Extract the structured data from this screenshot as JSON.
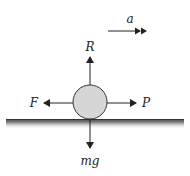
{
  "diagram": {
    "type": "free-body diagram",
    "object": "ball on horizontal surface",
    "forces": [
      {
        "label": "R",
        "direction": "up",
        "meaning": "normal reaction"
      },
      {
        "label": "F",
        "direction": "left",
        "meaning": "friction"
      },
      {
        "label": "P",
        "direction": "right",
        "meaning": "applied force"
      },
      {
        "label": "mg",
        "direction": "down",
        "meaning": "weight"
      }
    ],
    "acceleration": {
      "label": "a",
      "direction": "right"
    },
    "colors": {
      "ball_fill": "#d6d6d6",
      "ball_stroke": "#333333",
      "arrow": "#222222",
      "ground": "#555555"
    }
  }
}
